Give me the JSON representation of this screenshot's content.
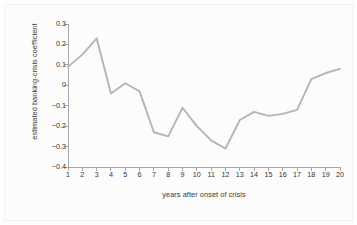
{
  "chart_data": {
    "type": "line",
    "title": "",
    "subtitle": "",
    "xlabel": "years after onset of crisis",
    "ylabel": "estimated banking-crisis coefficient",
    "x": [
      1,
      2,
      3,
      4,
      5,
      6,
      7,
      8,
      9,
      10,
      11,
      12,
      13,
      14,
      15,
      16,
      17,
      18,
      19,
      20
    ],
    "values": [
      0.09,
      0.15,
      0.23,
      -0.04,
      0.01,
      -0.03,
      -0.23,
      -0.25,
      -0.11,
      -0.2,
      -0.27,
      -0.31,
      -0.17,
      -0.13,
      -0.15,
      -0.14,
      -0.12,
      0.03,
      0.06,
      0.08
    ],
    "series": [
      {
        "name": "estimated banking-crisis coefficient",
        "values": [
          0.09,
          0.15,
          0.23,
          -0.04,
          0.01,
          -0.03,
          -0.23,
          -0.25,
          -0.11,
          -0.2,
          -0.27,
          -0.31,
          -0.17,
          -0.13,
          -0.15,
          -0.14,
          -0.12,
          0.03,
          0.06,
          0.08
        ],
        "color": "#b5b5b5"
      }
    ],
    "xlim": [
      1,
      20
    ],
    "ylim": [
      -0.4,
      0.3
    ],
    "ytick_labels": [
      "0.3",
      "0.2",
      "0.1",
      "0",
      "-0.1",
      "-0.2",
      "-0.3",
      "-0.4"
    ],
    "ytick_values": [
      0.3,
      0.2,
      0.1,
      0,
      -0.1,
      -0.2,
      -0.3,
      -0.4
    ],
    "xtick_labels": [
      "1",
      "2",
      "3",
      "4",
      "5",
      "6",
      "7",
      "8",
      "9",
      "10",
      "11",
      "12",
      "13",
      "14",
      "15",
      "16",
      "17",
      "18",
      "19",
      "20"
    ],
    "grid": false,
    "legend": null,
    "legend_position": "none",
    "annotations": [],
    "line_color": "#b5b5b5",
    "axis_color": "#a8a8a8",
    "background_color": "#fcfcfc"
  }
}
